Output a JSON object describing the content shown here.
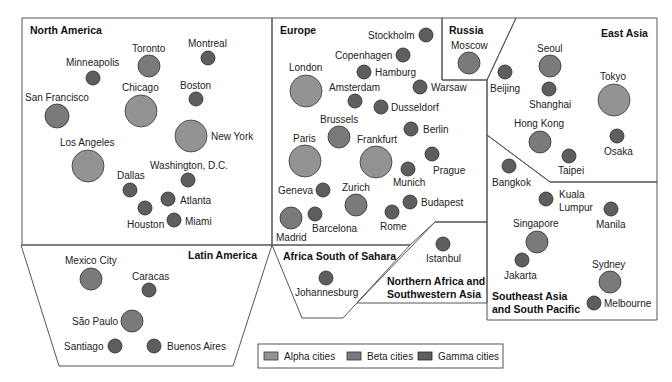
{
  "colors": {
    "alpha": "#939393",
    "beta": "#7a7a7a",
    "gamma": "#5e5e5e",
    "border": "#555555"
  },
  "legend": {
    "items": [
      {
        "key": "alpha",
        "label": "Alpha cities"
      },
      {
        "key": "beta",
        "label": "Beta cities"
      },
      {
        "key": "gamma",
        "label": "Gamma cities"
      }
    ]
  },
  "regions": [
    {
      "id": "north-america",
      "label": "North America"
    },
    {
      "id": "latin-america",
      "label": "Latin America"
    },
    {
      "id": "europe",
      "label": "Europe"
    },
    {
      "id": "russia",
      "label": "Russia"
    },
    {
      "id": "east-asia",
      "label": "East Asia"
    },
    {
      "id": "africa-south-of-sahara",
      "label": "Africa South of Sahara"
    },
    {
      "id": "northern-africa-sw-asia",
      "label_line1": "Northern Africa and",
      "label_line2": "Southwestern Asia"
    },
    {
      "id": "southeast-asia-south-pacific",
      "label_line1": "Southeast Asia",
      "label_line2": "and South Pacific"
    }
  ],
  "cities": [
    {
      "name": "Toronto",
      "tier": "beta",
      "region": "North America"
    },
    {
      "name": "Montreal",
      "tier": "gamma",
      "region": "North America"
    },
    {
      "name": "Minneapolis",
      "tier": "gamma",
      "region": "North America"
    },
    {
      "name": "Chicago",
      "tier": "alpha",
      "region": "North America"
    },
    {
      "name": "Boston",
      "tier": "gamma",
      "region": "North America"
    },
    {
      "name": "San Francisco",
      "tier": "beta",
      "region": "North America"
    },
    {
      "name": "New York",
      "tier": "alpha",
      "region": "North America"
    },
    {
      "name": "Los Angeles",
      "tier": "alpha",
      "region": "North America"
    },
    {
      "name": "Washington, D.C.",
      "tier": "gamma",
      "region": "North America"
    },
    {
      "name": "Dallas",
      "tier": "gamma",
      "region": "North America"
    },
    {
      "name": "Atlanta",
      "tier": "gamma",
      "region": "North America"
    },
    {
      "name": "Houston",
      "tier": "gamma",
      "region": "North America"
    },
    {
      "name": "Miami",
      "tier": "gamma",
      "region": "North America"
    },
    {
      "name": "Mexico City",
      "tier": "beta",
      "region": "Latin America"
    },
    {
      "name": "Caracas",
      "tier": "gamma",
      "region": "Latin America"
    },
    {
      "name": "São Paulo",
      "tier": "beta",
      "region": "Latin America"
    },
    {
      "name": "Santiago",
      "tier": "gamma",
      "region": "Latin America"
    },
    {
      "name": "Buenos Aires",
      "tier": "gamma",
      "region": "Latin America"
    },
    {
      "name": "Stockholm",
      "tier": "gamma",
      "region": "Europe"
    },
    {
      "name": "Copenhagen",
      "tier": "gamma",
      "region": "Europe"
    },
    {
      "name": "London",
      "tier": "alpha",
      "region": "Europe"
    },
    {
      "name": "Hamburg",
      "tier": "gamma",
      "region": "Europe"
    },
    {
      "name": "Amsterdam",
      "tier": "gamma",
      "region": "Europe"
    },
    {
      "name": "Warsaw",
      "tier": "gamma",
      "region": "Europe"
    },
    {
      "name": "Dusseldorf",
      "tier": "gamma",
      "region": "Europe"
    },
    {
      "name": "Brussels",
      "tier": "beta",
      "region": "Europe"
    },
    {
      "name": "Berlin",
      "tier": "gamma",
      "region": "Europe"
    },
    {
      "name": "Paris",
      "tier": "alpha",
      "region": "Europe"
    },
    {
      "name": "Frankfurt",
      "tier": "alpha",
      "region": "Europe"
    },
    {
      "name": "Prague",
      "tier": "gamma",
      "region": "Europe"
    },
    {
      "name": "Munich",
      "tier": "gamma",
      "region": "Europe"
    },
    {
      "name": "Geneva",
      "tier": "gamma",
      "region": "Europe"
    },
    {
      "name": "Zurich",
      "tier": "beta",
      "region": "Europe"
    },
    {
      "name": "Budapest",
      "tier": "gamma",
      "region": "Europe"
    },
    {
      "name": "Madrid",
      "tier": "beta",
      "region": "Europe"
    },
    {
      "name": "Barcelona",
      "tier": "gamma",
      "region": "Europe"
    },
    {
      "name": "Rome",
      "tier": "gamma",
      "region": "Europe"
    },
    {
      "name": "Moscow",
      "tier": "beta",
      "region": "Russia"
    },
    {
      "name": "Seoul",
      "tier": "beta",
      "region": "East Asia"
    },
    {
      "name": "Beijing",
      "tier": "gamma",
      "region": "East Asia"
    },
    {
      "name": "Tokyo",
      "tier": "alpha",
      "region": "East Asia"
    },
    {
      "name": "Shanghai",
      "tier": "gamma",
      "region": "East Asia"
    },
    {
      "name": "Hong Kong",
      "tier": "beta",
      "region": "East Asia"
    },
    {
      "name": "Osaka",
      "tier": "gamma",
      "region": "East Asia"
    },
    {
      "name": "Taipei",
      "tier": "gamma",
      "region": "East Asia"
    },
    {
      "name": "Johannesburg",
      "tier": "gamma",
      "region": "Africa South of Sahara"
    },
    {
      "name": "Istanbul",
      "tier": "gamma",
      "region": "Northern Africa and Southwestern Asia"
    },
    {
      "name": "Bangkok",
      "tier": "gamma",
      "region": "Southeast Asia and South Pacific"
    },
    {
      "name": "Kuala",
      "name_line2": "Lumpur",
      "tier": "gamma",
      "region": "Southeast Asia and South Pacific"
    },
    {
      "name": "Manila",
      "tier": "gamma",
      "region": "Southeast Asia and South Pacific"
    },
    {
      "name": "Singapore",
      "tier": "beta",
      "region": "Southeast Asia and South Pacific"
    },
    {
      "name": "Jakarta",
      "tier": "gamma",
      "region": "Southeast Asia and South Pacific"
    },
    {
      "name": "Sydney",
      "tier": "beta",
      "region": "Southeast Asia and South Pacific"
    },
    {
      "name": "Melbourne",
      "tier": "gamma",
      "region": "Southeast Asia and South Pacific"
    }
  ]
}
